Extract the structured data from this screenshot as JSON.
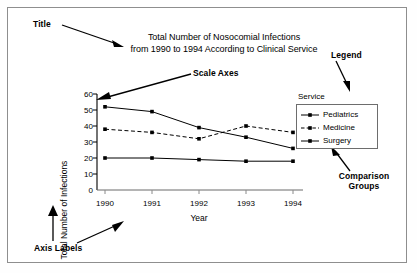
{
  "figure": {
    "title_line1": "Total Number of Nosocomial Infections",
    "title_line2": "from 1990 to 1994 According to Clinical Service"
  },
  "annotations": {
    "title": "Title",
    "scale_axes": "Scale Axes",
    "legend": "Legend",
    "comparison_groups_line1": "Comparison",
    "comparison_groups_line2": "Groups",
    "axis_labels": "Axis Labels"
  },
  "legend": {
    "heading": "Service",
    "entries": [
      {
        "label": "Pediatrics",
        "style": "solid",
        "marker": "square",
        "color": "#000000"
      },
      {
        "label": "Medicine",
        "style": "dashed",
        "marker": "square",
        "color": "#000000"
      },
      {
        "label": "Surgery",
        "style": "solid",
        "marker": "square",
        "color": "#000000"
      }
    ]
  },
  "chart_data": {
    "type": "line",
    "title": "Total Number of Nosocomial Infections from 1990 to 1994 According to Clinical Service",
    "xlabel": "Year",
    "ylabel": "Total Number of Infections",
    "categories": [
      "1990",
      "1991",
      "1992",
      "1993",
      "1994"
    ],
    "x": [
      1990,
      1991,
      1992,
      1993,
      1994
    ],
    "ylim": [
      0,
      60
    ],
    "yticks": [
      0,
      10,
      20,
      30,
      40,
      50,
      60
    ],
    "grid": false,
    "legend_position": "right",
    "series": [
      {
        "name": "Pediatrics",
        "values": [
          52,
          49,
          39,
          33,
          26
        ],
        "style": "solid",
        "marker": "square"
      },
      {
        "name": "Medicine",
        "values": [
          38,
          36,
          32,
          40,
          36
        ],
        "style": "dashed",
        "marker": "square"
      },
      {
        "name": "Surgery",
        "values": [
          20,
          20,
          19,
          18,
          18
        ],
        "style": "solid",
        "marker": "square"
      }
    ]
  }
}
